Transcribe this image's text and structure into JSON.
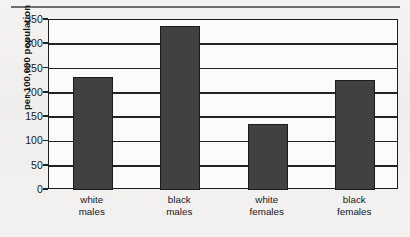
{
  "figure": {
    "top_rule": "horizontal-rule",
    "background_color": "#f2f1ef"
  },
  "chart_data": {
    "type": "bar",
    "title": "",
    "xlabel": "",
    "ylabel": "per 100,000 population",
    "categories": [
      "white males",
      "black males",
      "white females",
      "black females"
    ],
    "category_lines": [
      [
        "white",
        "males"
      ],
      [
        "black",
        "males"
      ],
      [
        "white",
        "females"
      ],
      [
        "black",
        "females"
      ]
    ],
    "values": [
      232,
      337,
      135,
      227
    ],
    "ylim": [
      0,
      350
    ],
    "ytick_labels": [
      "350",
      "300",
      "250",
      "200",
      "150",
      "100",
      "50",
      "0"
    ],
    "ytick_values": [
      350,
      300,
      250,
      200,
      150,
      100,
      50,
      0
    ],
    "grid": true,
    "legend": "none",
    "bar_color": "#414141",
    "bar_edge_color": "#1b1b1b",
    "axis_color": "#1d1d1d",
    "plot_background": "#fbfbfa"
  }
}
